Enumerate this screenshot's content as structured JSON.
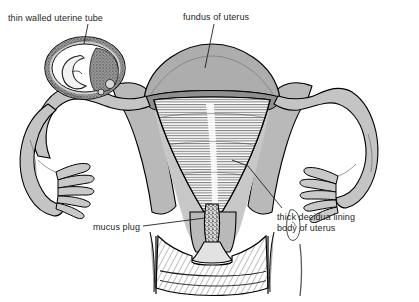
{
  "figure": {
    "width": 419,
    "height": 302,
    "background_color": "#ffffff",
    "style": "black-and-white line drawing with grey tone fills"
  },
  "labels": {
    "uterine_tube": "thin walled uterine tube",
    "fundus": "fundus of uterus",
    "decidua_line1": "thick decidua lining",
    "decidua_line2": "body of uterus",
    "mucus_plug": "mucus plug"
  },
  "colors": {
    "ink": "#231f20",
    "outline": "#000000",
    "wall_grey": "#b3b3b3",
    "fundus_grey": "#adadad",
    "tube_grey": "#c4c4c4",
    "dark_grey": "#7d7d7d",
    "cavity_white": "#ffffff",
    "plug_grey": "#8c8c8c",
    "background": "#ffffff"
  },
  "structures": [
    {
      "name": "fundus-of-uterus",
      "description": "domed grey top of the uterus"
    },
    {
      "name": "body-of-uterus",
      "description": "triangular muscular body with grey walls"
    },
    {
      "name": "uterine-cavity",
      "description": "white triangular cavity with fine hatched decidua lining"
    },
    {
      "name": "left-uterine-tube",
      "description": "thin walled tube swollen around an ectopic gestation"
    },
    {
      "name": "ectopic-gestation-sac",
      "description": "dilated tube containing an embryo and villi"
    },
    {
      "name": "right-uterine-tube",
      "description": "normal thin walled tube curving laterally"
    },
    {
      "name": "left-fimbriae",
      "description": "finger-like projections at the end of the left tube"
    },
    {
      "name": "right-fimbriae",
      "description": "finger-like projections at the end of the right tube"
    },
    {
      "name": "cervical-canal",
      "description": "narrow canal filled with stippled mucus plug"
    },
    {
      "name": "mucus-plug",
      "description": "stippled plug occluding the cervical canal"
    },
    {
      "name": "vaginal-fornices",
      "description": "hatched vaginal walls around the cervix"
    }
  ]
}
